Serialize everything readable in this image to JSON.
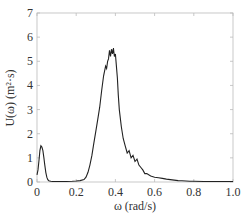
{
  "chart_data": {
    "type": "line",
    "title": "",
    "xlabel": "ω (rad/s)",
    "ylabel": "U(ω)  (m²·s)",
    "xlim": [
      0,
      1.0
    ],
    "ylim": [
      0,
      7
    ],
    "xticks": [
      "0",
      "0.2",
      "0.4",
      "0.6",
      "0.8",
      "1.0"
    ],
    "yticks": [
      "0",
      "1",
      "2",
      "3",
      "4",
      "5",
      "6",
      "7"
    ],
    "grid": false,
    "legend": null,
    "series": [
      {
        "name": "U(ω)",
        "color": "#222222",
        "x": [
          0.0,
          0.005,
          0.01,
          0.015,
          0.02,
          0.025,
          0.03,
          0.035,
          0.04,
          0.045,
          0.05,
          0.055,
          0.06,
          0.07,
          0.08,
          0.09,
          0.1,
          0.12,
          0.15,
          0.18,
          0.2,
          0.22,
          0.24,
          0.25,
          0.26,
          0.27,
          0.28,
          0.29,
          0.3,
          0.31,
          0.32,
          0.33,
          0.34,
          0.35,
          0.355,
          0.36,
          0.365,
          0.37,
          0.375,
          0.38,
          0.385,
          0.39,
          0.395,
          0.4,
          0.405,
          0.41,
          0.415,
          0.42,
          0.43,
          0.44,
          0.45,
          0.46,
          0.47,
          0.48,
          0.49,
          0.5,
          0.51,
          0.52,
          0.53,
          0.54,
          0.55,
          0.56,
          0.57,
          0.58,
          0.6,
          0.62,
          0.64,
          0.66,
          0.68,
          0.7,
          0.72,
          0.74,
          0.76,
          0.78,
          0.8,
          0.85,
          0.9,
          0.95,
          1.0
        ],
        "y": [
          0.3,
          0.5,
          0.9,
          1.3,
          1.5,
          1.45,
          1.3,
          1.0,
          0.7,
          0.4,
          0.2,
          0.1,
          0.05,
          0.03,
          0.02,
          0.02,
          0.02,
          0.02,
          0.02,
          0.03,
          0.04,
          0.06,
          0.1,
          0.2,
          0.4,
          0.7,
          1.1,
          1.6,
          2.1,
          2.6,
          3.1,
          3.8,
          4.4,
          4.8,
          4.7,
          5.0,
          5.1,
          5.45,
          5.2,
          5.5,
          5.3,
          5.55,
          5.2,
          5.3,
          4.8,
          4.3,
          3.6,
          3.0,
          2.3,
          1.8,
          1.5,
          1.2,
          1.3,
          1.0,
          1.1,
          0.85,
          0.95,
          0.7,
          0.6,
          0.5,
          0.35,
          0.35,
          0.3,
          0.25,
          0.2,
          0.18,
          0.15,
          0.12,
          0.1,
          0.08,
          0.06,
          0.05,
          0.04,
          0.03,
          0.03,
          0.02,
          0.02,
          0.02,
          0.02
        ]
      }
    ]
  }
}
